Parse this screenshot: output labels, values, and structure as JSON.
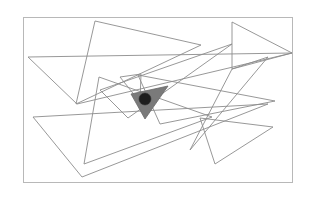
{
  "figure": {
    "colors": {
      "frame": "#b8b8b8",
      "triangle_stroke": "#8c8c8c",
      "target_fill": "#7a7a7a",
      "point_fill": "#1e1e1e",
      "background": "#ffffff"
    },
    "triangle_count": 10,
    "shaded_triangle_count": 1,
    "point_count": 1
  }
}
